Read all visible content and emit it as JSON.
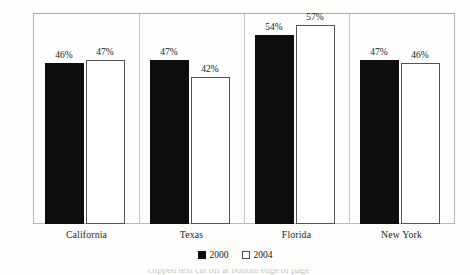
{
  "chart_data": {
    "type": "bar",
    "title": "",
    "xlabel": "",
    "ylabel": "",
    "categories": [
      "California",
      "Texas",
      "Florida",
      "New York"
    ],
    "series": [
      {
        "name": "2000",
        "color": "#0d0d0d",
        "values": [
          46,
          47,
          54,
          47
        ],
        "labels": [
          "46%",
          "47%",
          "54%",
          "47%"
        ]
      },
      {
        "name": "2004",
        "color": "#ffffff",
        "values": [
          47,
          42,
          57,
          46
        ],
        "labels": [
          "47%",
          "42%",
          "57%",
          "46%"
        ]
      }
    ],
    "ylim": [
      0,
      60
    ],
    "ytick_values": [
      0,
      10,
      20,
      30,
      40,
      50,
      60
    ],
    "ytick_labels": [
      "0%",
      "10%",
      "20%",
      "30%",
      "40%",
      "50%",
      "60%"
    ],
    "grid": false,
    "legend_position": "bottom-center",
    "value_labels_shown": true,
    "group_separators": true
  },
  "legend": {
    "items": [
      {
        "label": "2000",
        "swatch": "filled-black-square"
      },
      {
        "label": "2004",
        "swatch": "outlined-white-square"
      }
    ]
  },
  "footnote": {
    "text": "clipped text cut off at bottom edge of page"
  }
}
